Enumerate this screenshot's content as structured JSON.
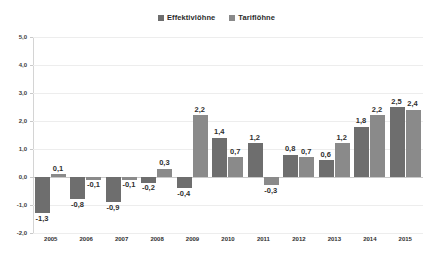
{
  "chart_data": {
    "type": "bar",
    "title": "",
    "subtitle": "",
    "xlabel": "",
    "ylabel": "",
    "ylim": [
      -2.0,
      5.0
    ],
    "ytick_step": 1.0,
    "ytick_labels": [
      "5,0",
      "4,0",
      "3,0",
      "2,0",
      "1,0",
      "0,0",
      "-1,0",
      "-2,0"
    ],
    "ytick_values": [
      5.0,
      4.0,
      3.0,
      2.0,
      1.0,
      0.0,
      -1.0,
      -2.0
    ],
    "grid": true,
    "legend_position": "top-center",
    "decimal_separator": ",",
    "categories": [
      "2005",
      "2006",
      "2007",
      "2008",
      "2009",
      "2010",
      "2011",
      "2012",
      "2013",
      "2014",
      "2015"
    ],
    "series": [
      {
        "name": "Effektivlöhne",
        "color": "#6e6e6e",
        "values": [
          -1.3,
          -0.8,
          -0.9,
          -0.2,
          -0.4,
          1.4,
          1.2,
          0.8,
          0.6,
          1.8,
          2.5
        ],
        "labels": [
          "-1,3",
          "-0,8",
          "-0,9",
          "-0,2",
          "-0,4",
          "1,4",
          "1,2",
          "0,8",
          "0,6",
          "1,8",
          "2,5"
        ]
      },
      {
        "name": "Tariflöhne",
        "color": "#8a8a8a",
        "values": [
          0.1,
          -0.1,
          -0.1,
          0.3,
          2.2,
          0.7,
          -0.3,
          0.7,
          1.2,
          2.2,
          2.4
        ],
        "labels": [
          "0,1",
          "-0,1",
          "-0,1",
          "0,3",
          "2,2",
          "0,7",
          "-0,3",
          "0,7",
          "1,2",
          "2,2",
          "2,4"
        ]
      }
    ]
  },
  "legend": {
    "items": [
      {
        "label": "Effektivlöhne",
        "color": "#6e6e6e"
      },
      {
        "label": "Tariflöhne",
        "color": "#8a8a8a"
      }
    ]
  },
  "colors": {
    "series_1": "#6e6e6e",
    "series_2": "#8a8a8a",
    "background": "#ffffff",
    "gridline": "#ededed",
    "axis": "#c9c9c9",
    "text": "#2f2f2f"
  }
}
